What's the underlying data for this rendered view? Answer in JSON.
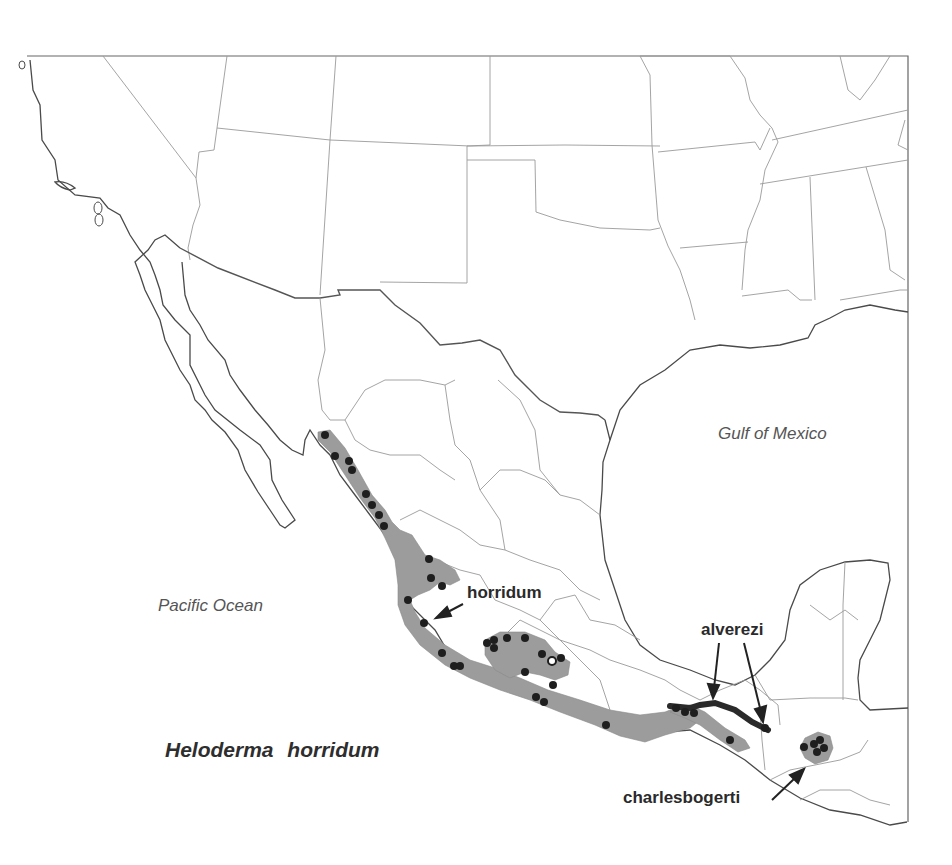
{
  "map": {
    "title": "Heloderma horridum",
    "water_labels": {
      "gulf": "Gulf of Mexico",
      "pacific": "Pacific Ocean"
    },
    "subspecies_labels": {
      "horridum": "horridum",
      "alvarezi": "alverezi",
      "charlesbogerti": "charlesbogerti"
    },
    "colors": {
      "range_fill": "#9c9c9c",
      "locality_dot": "#1e1e1e",
      "open_locality": "#ffffff",
      "border": "#555555"
    },
    "legend": {
      "shaded_area": "range",
      "dots": "locality records",
      "open_circle": "single open-circle locality"
    }
  }
}
